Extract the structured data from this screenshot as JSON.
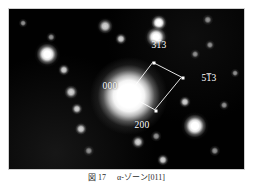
{
  "figure": {
    "kind": "electron-diffraction-pattern",
    "background_color": "#000000",
    "label_color": "#ffffff",
    "plate": {
      "x": 8,
      "y": 8,
      "width": 237,
      "height": 162
    }
  },
  "caption": {
    "figure_number": "図 17",
    "text": "α-ゾーン[011]",
    "full": "図 17　α-ゾーン[011]"
  },
  "chart_data": {
    "type": "scatter",
    "title": "",
    "xlabel": "",
    "ylabel": "",
    "grid": false,
    "legend": "none",
    "xlim": [
      0,
      237
    ],
    "ylim": [
      0,
      162
    ],
    "note": "Selected-area electron diffraction spot pattern; coordinates are in plate pixels, origin top-left of the black plate.",
    "central_beam": {
      "label": "000",
      "x": 120,
      "y": 87,
      "radius": 17
    },
    "indexed_reflections": [
      {
        "label": "313",
        "overbar_digits": [
          1
        ],
        "x": 145,
        "y": 54,
        "label_x": 150,
        "label_y": 37
      },
      {
        "label": "513",
        "overbar_digits": [
          1
        ],
        "x": 174,
        "y": 69,
        "label_x": 200,
        "label_y": 70
      },
      {
        "label": "200",
        "overbar_digits": [],
        "x": 147,
        "y": 102,
        "label_x": 133,
        "label_y": 117
      },
      {
        "label": "000",
        "overbar_digits": [],
        "x": 120,
        "y": 87,
        "label_x": 101,
        "label_y": 78
      }
    ],
    "vectors": [
      {
        "from": "000",
        "to": "313"
      },
      {
        "from": "313",
        "to": "513"
      },
      {
        "from": "513",
        "to": "200"
      },
      {
        "from": "200",
        "to": "000"
      }
    ],
    "spots": [
      {
        "x": 14,
        "y": 14,
        "r": 2.0,
        "i": "dim"
      },
      {
        "x": 42,
        "y": 28,
        "r": 2.2,
        "i": "dim"
      },
      {
        "x": 96,
        "y": 17,
        "r": 4.0,
        "i": "faint"
      },
      {
        "x": 150,
        "y": 14,
        "r": 4.2,
        "i": "bright"
      },
      {
        "x": 199,
        "y": 11,
        "r": 2.6,
        "i": "dim"
      },
      {
        "x": 38,
        "y": 45,
        "r": 5.8,
        "i": "bright"
      },
      {
        "x": 112,
        "y": 30,
        "r": 3.0,
        "i": "faint"
      },
      {
        "x": 147,
        "y": 28,
        "r": 5.4,
        "i": "bright"
      },
      {
        "x": 201,
        "y": 36,
        "r": 2.3,
        "i": "dim"
      },
      {
        "x": 55,
        "y": 61,
        "r": 3.0,
        "i": "faint"
      },
      {
        "x": 186,
        "y": 45,
        "r": 2.2,
        "i": "dim"
      },
      {
        "x": 62,
        "y": 83,
        "r": 3.6,
        "i": "faint"
      },
      {
        "x": 176,
        "y": 93,
        "r": 3.0,
        "i": "faint"
      },
      {
        "x": 68,
        "y": 100,
        "r": 3.0,
        "i": "faint"
      },
      {
        "x": 72,
        "y": 120,
        "r": 3.2,
        "i": "faint"
      },
      {
        "x": 80,
        "y": 142,
        "r": 2.6,
        "i": "dim"
      },
      {
        "x": 129,
        "y": 133,
        "r": 3.4,
        "i": "faint"
      },
      {
        "x": 147,
        "y": 127,
        "r": 2.4,
        "i": "dim"
      },
      {
        "x": 154,
        "y": 151,
        "r": 3.0,
        "i": "faint"
      },
      {
        "x": 186,
        "y": 117,
        "r": 6.4,
        "i": "bright"
      },
      {
        "x": 206,
        "y": 142,
        "r": 2.6,
        "i": "dim"
      },
      {
        "x": 215,
        "y": 96,
        "r": 2.2,
        "i": "dim"
      },
      {
        "x": 226,
        "y": 64,
        "r": 2.0,
        "i": "dim"
      }
    ]
  }
}
